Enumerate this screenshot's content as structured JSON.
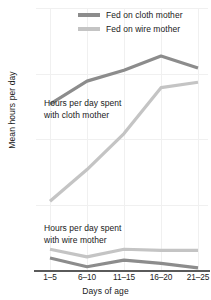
{
  "chart_data": {
    "type": "line",
    "title": "",
    "xlabel": "Days of age",
    "ylabel": "Mean hours per day",
    "categories": [
      "1–5",
      "6–10",
      "11–15",
      "16–20",
      "21–25"
    ],
    "yticks": [
      0,
      6,
      12,
      18,
      24
    ],
    "ylim": [
      0,
      24
    ],
    "grid": true,
    "legend_position": "top-right",
    "legend": [
      {
        "label": "Fed on cloth mother",
        "color": "#8c8c8c"
      },
      {
        "label": "Fed on wire mother",
        "color": "#c4c4c4"
      }
    ],
    "annotations": [
      {
        "text_line1": "Hours per day spent",
        "text_line2": "with cloth mother"
      },
      {
        "text_line1": "Hours per day spent",
        "text_line2": "with wire mother"
      }
    ],
    "series": [
      {
        "name": "Time with cloth mother — fed on cloth mother",
        "group": "cloth-mother",
        "color": "#8c8c8c",
        "values": [
          15.2,
          17.3,
          18.3,
          19.6,
          18.5
        ]
      },
      {
        "name": "Time with cloth mother — fed on wire mother",
        "group": "cloth-mother",
        "color": "#c4c4c4",
        "values": [
          6.3,
          9.2,
          12.5,
          16.7,
          17.2
        ]
      },
      {
        "name": "Time with wire mother — fed on wire mother",
        "group": "wire-mother",
        "color": "#c4c4c4",
        "values": [
          1.9,
          1.2,
          1.9,
          1.8,
          1.8
        ]
      },
      {
        "name": "Time with wire mother — fed on cloth mother",
        "group": "wire-mother",
        "color": "#8c8c8c",
        "values": [
          1.1,
          0.3,
          0.9,
          0.6,
          0.2
        ]
      }
    ]
  },
  "legend": {
    "cloth": "Fed on cloth mother",
    "wire": "Fed on wire mother"
  },
  "annotations": {
    "cloth_l1": "Hours per day spent",
    "cloth_l2": "with cloth mother",
    "wire_l1": "Hours per day spent",
    "wire_l2": "with wire mother"
  },
  "axes": {
    "x_title": "Days of age",
    "y_title": "Mean hours per day",
    "ytick_0": "0",
    "ytick_1": "6",
    "ytick_2": "12",
    "ytick_3": "18",
    "ytick_4": "24",
    "xtick_0": "1–5",
    "xtick_1": "6–10",
    "xtick_2": "11–15",
    "xtick_3": "16–20",
    "xtick_4": "21–25"
  }
}
